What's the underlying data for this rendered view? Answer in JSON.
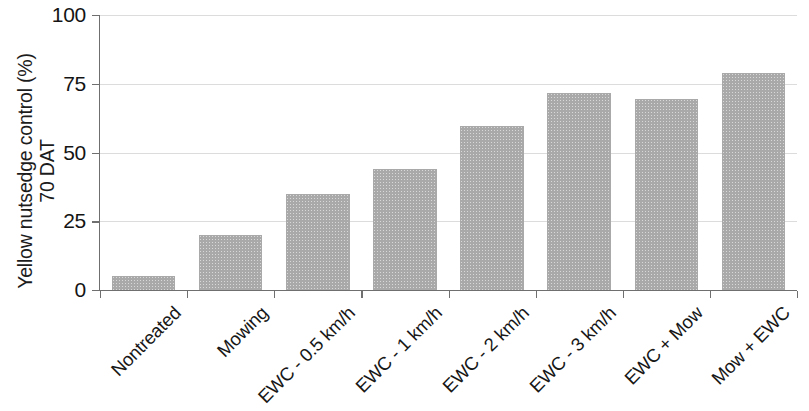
{
  "chart_data": {
    "type": "bar",
    "title": "",
    "xlabel": "",
    "ylabel_line1": "Yellow nutsedge control (%)",
    "ylabel_line2": "70 DAT",
    "ylim": [
      0,
      100
    ],
    "yticks": [
      0,
      25,
      50,
      75,
      100
    ],
    "ytick_labels": [
      "0",
      "25",
      "50",
      "75",
      "100"
    ],
    "grid": "horizontal",
    "legend": "none",
    "bar_color": "#a9a9a9",
    "categories": [
      "Nontreated",
      "Mowing",
      "EWC - 0.5 km/h",
      "EWC - 1 km/h",
      "EWC - 2 km/h",
      "EWC - 3 km/h",
      "EWC + Mow",
      "Mow + EWC"
    ],
    "values": [
      5,
      20,
      35,
      44,
      59.5,
      71.5,
      69.5,
      79
    ]
  }
}
